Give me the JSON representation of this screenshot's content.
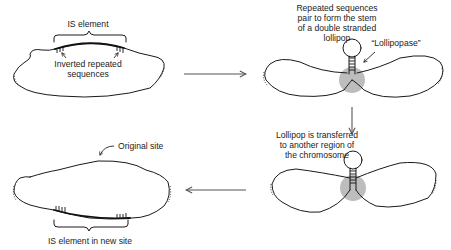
{
  "panels": {
    "step1": {
      "title_label": "IS element",
      "annotation": [
        "Inverted repeated",
        "sequences"
      ]
    },
    "step2": {
      "caption": [
        "Repeated sequences",
        "pair to form the stem",
        "of a double stranded",
        "lollipop"
      ],
      "enzyme_label": "“Lollipopase”"
    },
    "step3": {
      "caption": [
        "Lollipop is transferred",
        "to another region of",
        "the chromosome"
      ]
    },
    "step4": {
      "site_label": "Original site",
      "bottom_label": "IS element in new site"
    }
  },
  "colors": {
    "line": "#1a1a1a",
    "enzyme_shade": "#bdbdbd",
    "arrow": "#555555"
  }
}
